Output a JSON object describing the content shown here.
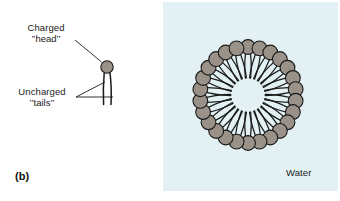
{
  "figure": {
    "panel_letter": "(b)",
    "domain": "scientific-diagram"
  },
  "labels": {
    "charged_head_line1": "Charged",
    "charged_head_line2": "’’head’’",
    "uncharged_tails_line1": "Uncharged",
    "uncharged_tails_line2": "’’tails’’",
    "water": "Water"
  },
  "colors": {
    "head_fill": "#9a9289",
    "head_stroke": "#1a1a1a",
    "tail_stroke": "#1a1a1a",
    "water_panel": "#e3f1f4",
    "page_background": "#ffffff",
    "text": "#1a1a1a",
    "leader_line": "#1a1a1a"
  },
  "molecule": {
    "name": "single-surfactant-molecule",
    "head_center_x": 107,
    "head_center_y": 67,
    "head_radius": 6.2,
    "tail_count": 2,
    "tail_length": 38
  },
  "micelle": {
    "name": "micelle-cross-section",
    "center_x": 248,
    "center_y": 95,
    "ring_radius": 48,
    "head_radius": 7.4,
    "head_count": 26,
    "core_radius": 17,
    "core_label": "water-free hydrophobic core",
    "tails_per_head": 2
  }
}
